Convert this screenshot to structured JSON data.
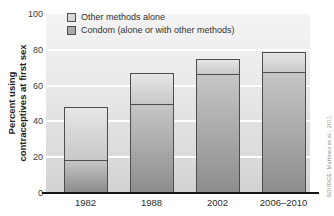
{
  "figure": {
    "source_note": "SOURCE: Martinez et al., 2011."
  },
  "chart_data": {
    "type": "bar",
    "stacked": true,
    "title": "",
    "xlabel": "",
    "ylabel": "Percent using contraceptives at first sex",
    "ylabel_lines": [
      "Percent using",
      "contraceptives at first sex"
    ],
    "categories": [
      "1982",
      "1988",
      "2002",
      "2006–2010"
    ],
    "series": [
      {
        "name": "Condom (alone or with other methods)",
        "values": [
          18,
          50,
          67,
          68
        ],
        "color": "#a8a8a8"
      },
      {
        "name": "Other methods alone",
        "values": [
          30,
          17,
          8,
          11
        ],
        "color": "#d7d7d7"
      }
    ],
    "totals": [
      48,
      67,
      75,
      79
    ],
    "ylim": [
      0,
      100
    ],
    "y_ticks": [
      0,
      20,
      40,
      60,
      80,
      100
    ],
    "grid": true,
    "gridline_color": "#ffffff",
    "legend_position": "top-left-inside",
    "legend_order": [
      1,
      0
    ]
  }
}
